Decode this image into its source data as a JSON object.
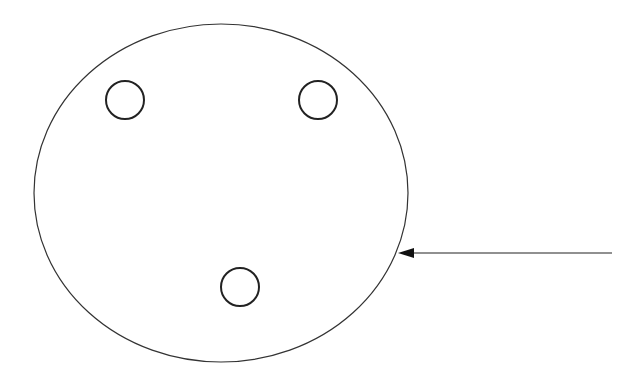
{
  "diagram": {
    "outer_ellipse": {
      "cx": 221,
      "cy": 193,
      "rx": 187,
      "ry": 169,
      "stroke": "#333333"
    },
    "holes": [
      {
        "cx": 125,
        "cy": 100,
        "rx": 19,
        "ry": 19
      },
      {
        "cx": 318,
        "cy": 100,
        "rx": 19,
        "ry": 19
      },
      {
        "cx": 240,
        "cy": 287,
        "rx": 19,
        "ry": 19
      }
    ],
    "arrow": {
      "x1": 612,
      "y1": 253,
      "x2": 398,
      "y2": 253,
      "color": "#222222"
    }
  }
}
